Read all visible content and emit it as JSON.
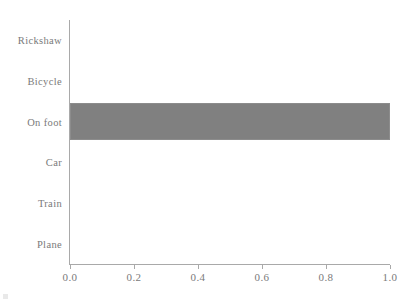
{
  "chart_data": {
    "type": "bar",
    "orientation": "horizontal",
    "title": "",
    "xlabel": "",
    "ylabel": "",
    "categories": [
      "Rickshaw",
      "Bicycle",
      "On foot",
      "Car",
      "Train",
      "Plane"
    ],
    "values": [
      0,
      0,
      1.0,
      0,
      0,
      0
    ],
    "xlim": [
      0.0,
      1.0
    ],
    "xticks": [
      "0.0",
      "0.2",
      "0.4",
      "0.6",
      "0.8",
      "1.0"
    ],
    "xtick_values": [
      0.0,
      0.2,
      0.4,
      0.6,
      0.8,
      1.0
    ],
    "grid": false,
    "legend": null,
    "bar_color": "#808080",
    "bar_edge_color": "#8c8c8c",
    "axis_color": "#a9a9a9",
    "text_color": "#7a7a7a",
    "background_color": "#ffffff"
  }
}
